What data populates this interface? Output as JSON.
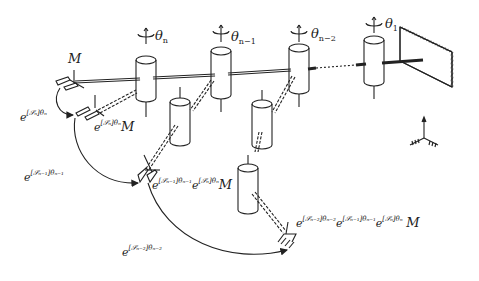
{
  "figure": {
    "colors": {
      "ink": "#222222",
      "background": "#ffffff"
    }
  },
  "joints": [
    {
      "id": "joint-n",
      "label": "θ",
      "sub": "n"
    },
    {
      "id": "joint-n-1",
      "label": "θ",
      "sub": "n−1"
    },
    {
      "id": "joint-n-2",
      "label": "θ",
      "sub": "n−2"
    },
    {
      "id": "joint-1",
      "label": "θ",
      "sub": "1"
    }
  ],
  "frames": {
    "home": {
      "label": "M"
    },
    "after_n": {
      "e": "e",
      "exp": "[𝒮ₙ]θₙ",
      "tail": "M"
    },
    "after_n1": {
      "e1": "e",
      "exp1": "[𝒮ₙ₋₁]θₙ₋₁",
      "e2": "e",
      "exp2": "[𝒮ₙ]θₙ",
      "tail": "M"
    },
    "after_n2": {
      "e1": "e",
      "exp1": "[𝒮ₙ₋₂]θₙ₋₂",
      "e2": "e",
      "exp2": "[𝒮ₙ₋₁]θₙ₋₁",
      "e3": "e",
      "exp3": "[𝒮ₙ]θₙ",
      "tail": "M"
    }
  },
  "arrows": [
    {
      "id": "arrow-n",
      "e": "e",
      "exp": "[𝒮ₙ]θₙ"
    },
    {
      "id": "arrow-n-1",
      "e": "e",
      "exp": "[𝒮ₙ₋₁]θₙ₋₁"
    },
    {
      "id": "arrow-n-2",
      "e": "e",
      "exp": "[𝒮ₙ₋₂]θₙ₋₂"
    }
  ]
}
